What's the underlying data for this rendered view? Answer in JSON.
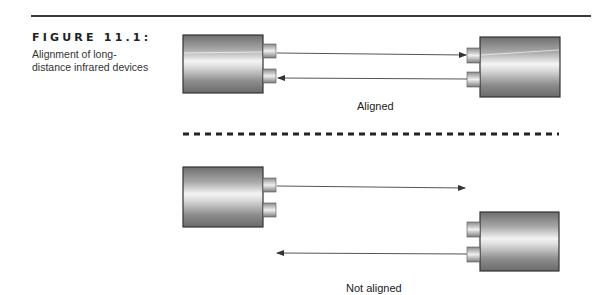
{
  "figure": {
    "number_label": "FIGURE 11.1:",
    "caption": "Alignment of long-distance infrared devices"
  },
  "panels": [
    {
      "label": "Aligned",
      "devices": [
        {
          "position": "left",
          "box": {
            "x": 183,
            "y": 35,
            "w": 80,
            "h": 58
          },
          "ports": [
            {
              "x": 263,
              "y": 44,
              "w": 13,
              "h": 14
            },
            {
              "x": 263,
              "y": 69,
              "w": 13,
              "h": 14
            }
          ]
        },
        {
          "position": "right",
          "box": {
            "x": 480,
            "y": 37,
            "w": 80,
            "h": 60
          },
          "ports": [
            {
              "x": 467,
              "y": 48,
              "w": 13,
              "h": 15
            },
            {
              "x": 467,
              "y": 72,
              "w": 13,
              "h": 15
            }
          ]
        }
      ],
      "beams": [
        {
          "direction": "left-to-right",
          "from": [
            277,
            53
          ],
          "to": [
            467,
            55
          ]
        },
        {
          "direction": "right-to-left",
          "from": [
            467,
            79
          ],
          "to": [
            277,
            78
          ]
        }
      ]
    },
    {
      "label": "Not aligned",
      "devices": [
        {
          "position": "left",
          "box": {
            "x": 183,
            "y": 167,
            "w": 80,
            "h": 60
          },
          "ports": [
            {
              "x": 263,
              "y": 178,
              "w": 13,
              "h": 14
            },
            {
              "x": 263,
              "y": 203,
              "w": 13,
              "h": 14
            }
          ]
        },
        {
          "position": "right",
          "box": {
            "x": 480,
            "y": 212,
            "w": 79,
            "h": 59
          },
          "ports": [
            {
              "x": 467,
              "y": 222,
              "w": 13,
              "h": 15
            },
            {
              "x": 467,
              "y": 247,
              "w": 13,
              "h": 15
            }
          ]
        }
      ],
      "beams": [
        {
          "direction": "left-to-right",
          "from": [
            277,
            186
          ],
          "to": [
            465,
            188
          ]
        },
        {
          "direction": "right-to-left",
          "from": [
            467,
            254
          ],
          "to": [
            277,
            253
          ]
        }
      ]
    }
  ],
  "colors": {
    "device_dark": "#7a7a7a",
    "device_light": "#f2f2f2",
    "outline": "#333333",
    "beam": "#555555",
    "divider": "#222222"
  }
}
